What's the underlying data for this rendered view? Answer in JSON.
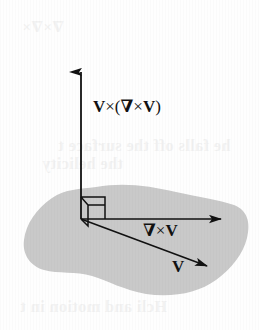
{
  "figure": {
    "caption_text": "",
    "background_color": "#fefefe",
    "surface": {
      "name": "plane-region-blob",
      "fill_color": "#c9c9c9",
      "description": "shaded amoeba-shaped plane region"
    },
    "vectors": [
      {
        "id": "v-cross-curl-v",
        "label": "V ×(∇ × V)",
        "label_plain": "V x (del x V)",
        "direction": "vertical-up",
        "color": "#111111",
        "origin": [
          81,
          219
        ],
        "tip": [
          81,
          65
        ]
      },
      {
        "id": "curl-v",
        "label": "∇ × V",
        "label_plain": "del x V",
        "direction": "horizontal-right",
        "color": "#111111",
        "origin": [
          81,
          219
        ],
        "tip": [
          227,
          219
        ]
      },
      {
        "id": "v",
        "label": "V",
        "label_plain": "V",
        "direction": "diagonal-down-right",
        "color": "#111111",
        "origin": [
          81,
          219
        ],
        "tip": [
          212,
          268
        ]
      }
    ],
    "right_angle_marker": {
      "name": "right-angle-marker",
      "description": "perspective square indicating perpendicularity at the origin",
      "color": "#111111"
    },
    "ghost_text": {
      "description": "faint bleed-through text from the reverse side of the scanned page",
      "color": "#f2f2f2",
      "lines": [
        "∇×∇×",
        "he falls off the surface t",
        "the helicity",
        "Hcli and motion in t"
      ]
    },
    "labels": {
      "vcurlv_bold_v1": "V",
      "vcurlv_times1": "×(",
      "vcurlv_nabla": "∇",
      "vcurlv_times2": "×",
      "vcurlv_bold_v2": "V",
      "vcurlv_close": ")",
      "curlv_nabla": "∇",
      "curlv_times": "×",
      "curlv_bold_v": "V",
      "v_bold": "V"
    }
  }
}
